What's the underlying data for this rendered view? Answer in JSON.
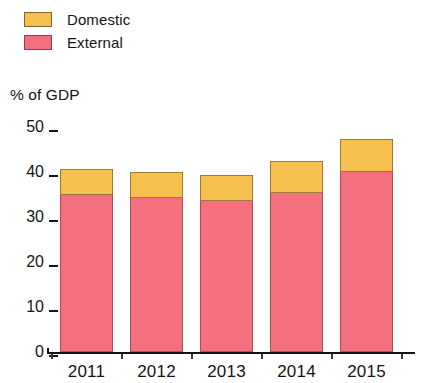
{
  "chart_data": {
    "type": "bar",
    "subtype": "stacked-column",
    "title": "",
    "subtitle": "",
    "xlabel": "",
    "ylabel": "% of GDP",
    "categories": [
      "2011",
      "2012",
      "2013",
      "2014",
      "2015"
    ],
    "series": [
      {
        "name": "External",
        "values": [
          34.9,
          34.3,
          33.6,
          35.3,
          40.0
        ],
        "color": "#f4707e"
      },
      {
        "name": "Domestic",
        "values": [
          5.8,
          5.7,
          5.7,
          7.1,
          7.3
        ],
        "color": "#f6c04e"
      }
    ],
    "totals": [
      40.7,
      40.0,
      39.3,
      42.4,
      47.3
    ],
    "ylim": [
      0,
      50
    ],
    "yticks": [
      "0",
      "10",
      "20",
      "30",
      "40",
      "50"
    ],
    "ytick_values": [
      0,
      10,
      20,
      30,
      40,
      50
    ],
    "grid": false,
    "legend_position": "top-left",
    "stack_order_bottom_to_top": [
      "External",
      "Domestic"
    ]
  },
  "legend": {
    "items": [
      {
        "label": "Domestic",
        "swatch": "domestic-swatch"
      },
      {
        "label": "External",
        "swatch": "external-swatch"
      }
    ]
  },
  "axes": {
    "y_title": "% of GDP"
  }
}
